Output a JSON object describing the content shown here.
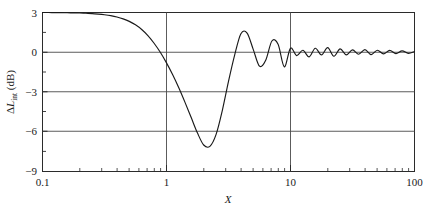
{
  "figure": {
    "background_color": "#ffffff",
    "frame_color": "#2b2b2b",
    "grid_color": "#4a4a4a",
    "curve_color": "#1a1a1a"
  },
  "axis_labels": {
    "x_title": "X",
    "y_title_delta": "Δ",
    "y_title_L": "L",
    "y_title_sub": "int",
    "y_title_units": " (dB)",
    "y_title_full": "ΔL₁ₙₜ (dB)"
  },
  "ticks": {
    "x_major": [
      "0.1",
      "1",
      "10",
      "100"
    ],
    "y_major": [
      "3",
      "0",
      "−3",
      "−6",
      "−9"
    ]
  },
  "chart_data": {
    "type": "line",
    "title": "",
    "xlabel": "X",
    "ylabel": "ΔL_int (dB)",
    "xscale": "log",
    "yscale": "linear",
    "xlim": [
      0.1,
      100
    ],
    "ylim": [
      -9,
      3
    ],
    "xticks": [
      0.1,
      1,
      10,
      100
    ],
    "yticks": [
      3,
      0,
      -3,
      -6,
      -9
    ],
    "grid": "major-x-and-y",
    "legend": "none",
    "series": [
      {
        "name": "ΔL_int",
        "x": [
          0.1,
          0.112,
          0.126,
          0.141,
          0.158,
          0.178,
          0.2,
          0.224,
          0.251,
          0.282,
          0.316,
          0.355,
          0.398,
          0.447,
          0.501,
          0.562,
          0.631,
          0.708,
          0.794,
          0.891,
          1.0,
          1.122,
          1.259,
          1.413,
          1.585,
          1.778,
          1.995,
          2.239,
          2.512,
          2.818,
          3.162,
          3.548,
          3.981,
          4.467,
          5.012,
          5.623,
          6.31,
          7.079,
          7.943,
          8.913,
          10.0,
          11.22,
          12.59,
          14.13,
          15.85,
          17.78,
          19.95,
          22.39,
          25.12,
          28.18,
          31.62,
          35.48,
          39.81,
          44.67,
          50.12,
          56.23,
          63.1,
          70.79,
          79.43,
          89.13,
          100.0
        ],
        "y": [
          3.0,
          3.0,
          2.99,
          2.99,
          2.98,
          2.97,
          2.96,
          2.94,
          2.92,
          2.88,
          2.83,
          2.76,
          2.66,
          2.52,
          2.33,
          2.07,
          1.72,
          1.26,
          0.68,
          0.0,
          -0.8,
          -1.7,
          -2.7,
          -3.8,
          -4.95,
          -6.1,
          -7.0,
          -7.1,
          -6.2,
          -4.4,
          -2.2,
          -0.2,
          1.4,
          1.45,
          0.2,
          -1.05,
          -0.6,
          0.85,
          0.6,
          -1.1,
          0.3,
          -0.25,
          0.15,
          -0.35,
          0.3,
          -0.2,
          0.35,
          -0.3,
          0.25,
          -0.2,
          0.18,
          -0.15,
          0.2,
          -0.18,
          0.15,
          -0.12,
          0.14,
          -0.1,
          0.1,
          -0.08,
          0.05
        ],
        "annotations": {
          "plateau_value_db": 3.0,
          "zero_crossing_x": 0.9,
          "minimum_x": 2.1,
          "minimum_y_db": -7.15,
          "first_rebound_peak_x": 3.8,
          "first_rebound_peak_y_db": 1.45,
          "asymptote_db": 0.0
        }
      }
    ]
  }
}
